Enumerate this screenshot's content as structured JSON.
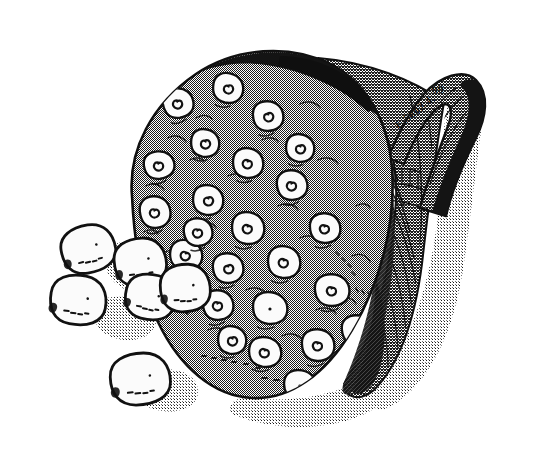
{
  "page": {
    "width": 536,
    "height": 453,
    "background_color": "#ffffff"
  },
  "illustration": {
    "subject": "lotus seed pod (receptacle) with loose seeds",
    "medium": "halftone-screened line drawing",
    "ink_color": "#111111",
    "halftone_gray": "#8c8c8c",
    "shadow_gray": "#c9c9c9",
    "seed_fill": "#fbfbfb"
  },
  "annotations": {
    "accession_number": "E.5602.4.",
    "year_mark": "99"
  },
  "pod": {
    "label": "seed-pod-body",
    "seed_cavity_count": 26,
    "seed_cavities": [
      {
        "cx": 178,
        "cy": 103,
        "rx": 15,
        "ry": 14,
        "rot": -12,
        "spiral": "left"
      },
      {
        "cx": 228,
        "cy": 88,
        "rx": 15,
        "ry": 14,
        "rot": 8,
        "spiral": "right"
      },
      {
        "cx": 268,
        "cy": 116,
        "rx": 15,
        "ry": 14,
        "rot": -4,
        "spiral": "right"
      },
      {
        "cx": 205,
        "cy": 143,
        "rx": 14,
        "ry": 13,
        "rot": 6,
        "spiral": "right"
      },
      {
        "cx": 159,
        "cy": 165,
        "rx": 15,
        "ry": 13,
        "rot": -10,
        "spiral": "left"
      },
      {
        "cx": 248,
        "cy": 163,
        "rx": 15,
        "ry": 14,
        "rot": 3,
        "spiral": "left"
      },
      {
        "cx": 292,
        "cy": 185,
        "rx": 15,
        "ry": 14,
        "rot": -6,
        "spiral": "left"
      },
      {
        "cx": 208,
        "cy": 200,
        "rx": 15,
        "ry": 14,
        "rot": 5,
        "spiral": "right"
      },
      {
        "cx": 155,
        "cy": 212,
        "rx": 15,
        "ry": 15,
        "rot": -8,
        "spiral": "left"
      },
      {
        "cx": 248,
        "cy": 228,
        "rx": 16,
        "ry": 15,
        "rot": 4,
        "spiral": "left"
      },
      {
        "cx": 325,
        "cy": 228,
        "rx": 15,
        "ry": 14,
        "rot": -3,
        "spiral": "left"
      },
      {
        "cx": 186,
        "cy": 255,
        "rx": 16,
        "ry": 14,
        "rot": 7,
        "spiral": "left"
      },
      {
        "cx": 228,
        "cy": 268,
        "rx": 15,
        "ry": 14,
        "rot": -5,
        "spiral": "right"
      },
      {
        "cx": 284,
        "cy": 262,
        "rx": 16,
        "ry": 15,
        "rot": 3,
        "spiral": "left"
      },
      {
        "cx": 332,
        "cy": 290,
        "rx": 17,
        "ry": 15,
        "rot": -4,
        "spiral": "left"
      },
      {
        "cx": 270,
        "cy": 308,
        "rx": 17,
        "ry": 15,
        "rot": 2,
        "spiral": "dot"
      },
      {
        "cx": 218,
        "cy": 305,
        "rx": 15,
        "ry": 14,
        "rot": -6,
        "spiral": "left"
      },
      {
        "cx": 172,
        "cy": 290,
        "rx": 14,
        "ry": 13,
        "rot": 8,
        "spiral": "right"
      },
      {
        "cx": 318,
        "cy": 345,
        "rx": 16,
        "ry": 15,
        "rot": -3,
        "spiral": "left"
      },
      {
        "cx": 265,
        "cy": 352,
        "rx": 16,
        "ry": 14,
        "rot": 5,
        "spiral": "left"
      },
      {
        "cx": 357,
        "cy": 330,
        "rx": 15,
        "ry": 14,
        "rot": -7,
        "spiral": "right"
      },
      {
        "cx": 300,
        "cy": 385,
        "rx": 16,
        "ry": 14,
        "rot": 4,
        "spiral": "dot"
      },
      {
        "cx": 348,
        "cy": 378,
        "rx": 14,
        "ry": 13,
        "rot": -5,
        "spiral": "left"
      },
      {
        "cx": 232,
        "cy": 340,
        "rx": 14,
        "ry": 13,
        "rot": 6,
        "spiral": "right"
      },
      {
        "cx": 198,
        "cy": 232,
        "rx": 14,
        "ry": 13,
        "rot": -9,
        "spiral": "left"
      },
      {
        "cx": 300,
        "cy": 148,
        "rx": 14,
        "ry": 13,
        "rot": 5,
        "spiral": "right"
      }
    ]
  },
  "loose_seeds": [
    {
      "name": "seed-upper-left",
      "cx": 88,
      "cy": 249,
      "rx": 27,
      "ry": 23,
      "rot": -14
    },
    {
      "name": "seed-mid-left",
      "cx": 78,
      "cy": 300,
      "rx": 28,
      "ry": 24,
      "rot": 6
    },
    {
      "name": "seed-center-upper",
      "cx": 140,
      "cy": 262,
      "rx": 26,
      "ry": 23,
      "rot": -8
    },
    {
      "name": "seed-center-lower",
      "cx": 150,
      "cy": 297,
      "rx": 25,
      "ry": 22,
      "rot": 10
    },
    {
      "name": "seed-attached",
      "cx": 185,
      "cy": 288,
      "rx": 25,
      "ry": 23,
      "rot": -4
    },
    {
      "name": "seed-bottom",
      "cx": 140,
      "cy": 379,
      "rx": 30,
      "ry": 25,
      "rot": -6
    }
  ],
  "stalk": {
    "label": "peduncle-stalk",
    "description": "curved hooked stalk at upper right"
  }
}
